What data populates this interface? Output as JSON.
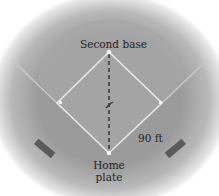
{
  "diagram": {
    "type": "baseball-diamond",
    "labels": {
      "second_base": "Second base",
      "home_plate_line1": "Home",
      "home_plate_line2": "plate",
      "side_length": "90 ft"
    },
    "colors": {
      "field": "#9b9b9b",
      "outfield_arc": "#a6a6a6",
      "base_lines": "#e6e6e6",
      "dashed_line": "#1a1a1a",
      "dugout": "#5a5a5a",
      "text": "#1e1e1e"
    }
  }
}
